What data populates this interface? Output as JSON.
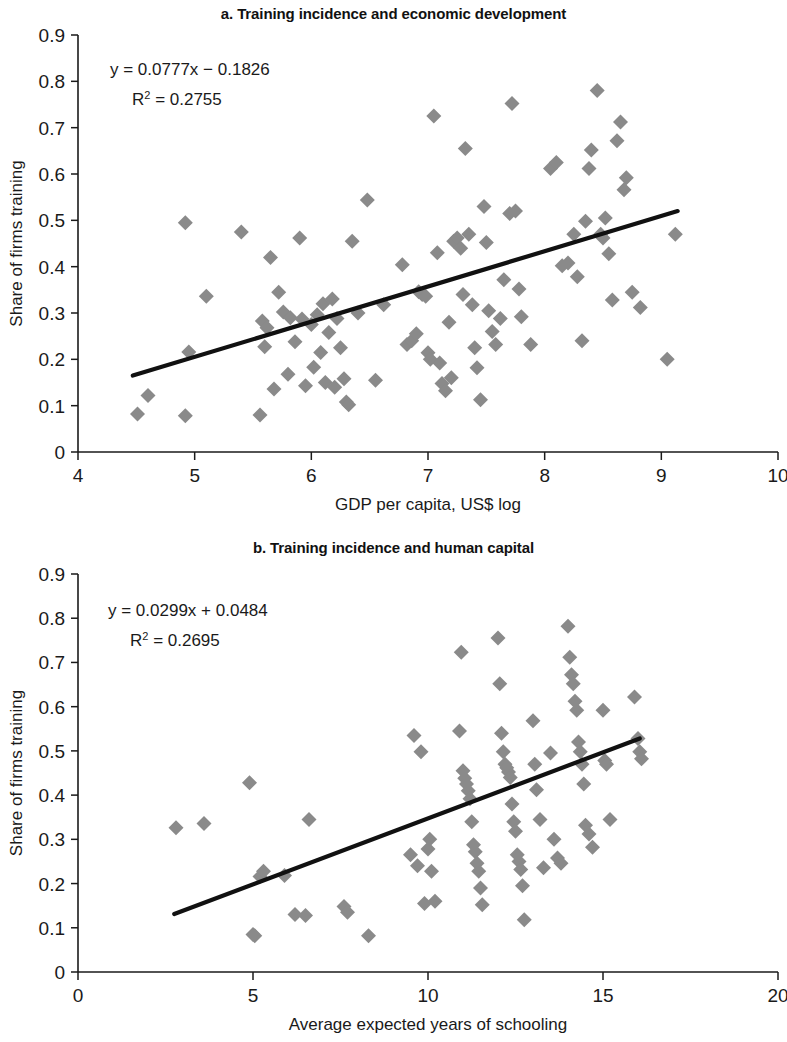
{
  "figure": {
    "background": "#ffffff",
    "marker_color": "#8a8a8a",
    "line_color": "#111111"
  },
  "chart_data": [
    {
      "type": "scatter",
      "panel": "a",
      "title": "a. Training incidence and economic development",
      "xlabel": "GDP per capita, US$ log",
      "ylabel": "Share of firms training",
      "xlim": [
        4,
        10
      ],
      "ylim": [
        0,
        0.9
      ],
      "xticks": [
        4,
        5,
        6,
        7,
        8,
        9,
        10
      ],
      "xtick_labels": [
        "4",
        "5",
        "6",
        "7",
        "8",
        "9",
        "10"
      ],
      "yticks": [
        0,
        0.1,
        0.2,
        0.3,
        0.4,
        0.5,
        0.6,
        0.7,
        0.8,
        0.9
      ],
      "ytick_labels": [
        "0",
        "0.1",
        "0.2",
        "0.3",
        "0.4",
        "0.5",
        "0.6",
        "0.7",
        "0.8",
        "0.9"
      ],
      "grid": false,
      "legend": "none",
      "annotations": {
        "equation": "y = 0.0777x − 0.1826",
        "r_squared_prefix": "R",
        "r_squared_sup": "2",
        "r_squared_value": " = 0.2755"
      },
      "trendline": {
        "slope": 0.0777,
        "intercept": -0.1826,
        "x_start": 4.47,
        "x_end": 9.14,
        "y_start": 0.165,
        "y_end": 0.52
      },
      "points": [
        [
          4.51,
          0.082
        ],
        [
          4.6,
          0.122
        ],
        [
          4.92,
          0.078
        ],
        [
          4.92,
          0.495
        ],
        [
          4.95,
          0.216
        ],
        [
          5.1,
          0.336
        ],
        [
          5.4,
          0.475
        ],
        [
          5.56,
          0.08
        ],
        [
          5.58,
          0.283
        ],
        [
          5.6,
          0.227
        ],
        [
          5.62,
          0.268
        ],
        [
          5.65,
          0.42
        ],
        [
          5.68,
          0.136
        ],
        [
          5.72,
          0.345
        ],
        [
          5.76,
          0.302
        ],
        [
          5.8,
          0.168
        ],
        [
          5.82,
          0.29
        ],
        [
          5.86,
          0.238
        ],
        [
          5.9,
          0.462
        ],
        [
          5.92,
          0.287
        ],
        [
          5.95,
          0.143
        ],
        [
          6.0,
          0.275
        ],
        [
          6.02,
          0.183
        ],
        [
          6.05,
          0.296
        ],
        [
          6.08,
          0.215
        ],
        [
          6.1,
          0.32
        ],
        [
          6.12,
          0.15
        ],
        [
          6.15,
          0.258
        ],
        [
          6.18,
          0.33
        ],
        [
          6.2,
          0.14
        ],
        [
          6.22,
          0.288
        ],
        [
          6.25,
          0.225
        ],
        [
          6.28,
          0.158
        ],
        [
          6.3,
          0.108
        ],
        [
          6.32,
          0.102
        ],
        [
          6.35,
          0.455
        ],
        [
          6.4,
          0.3
        ],
        [
          6.48,
          0.544
        ],
        [
          6.55,
          0.155
        ],
        [
          6.62,
          0.318
        ],
        [
          6.78,
          0.404
        ],
        [
          6.82,
          0.232
        ],
        [
          6.86,
          0.24
        ],
        [
          6.9,
          0.255
        ],
        [
          6.92,
          0.346
        ],
        [
          6.95,
          0.34
        ],
        [
          6.98,
          0.336
        ],
        [
          7.0,
          0.214
        ],
        [
          7.02,
          0.2
        ],
        [
          7.05,
          0.725
        ],
        [
          7.08,
          0.43
        ],
        [
          7.1,
          0.192
        ],
        [
          7.12,
          0.148
        ],
        [
          7.15,
          0.132
        ],
        [
          7.18,
          0.28
        ],
        [
          7.2,
          0.16
        ],
        [
          7.22,
          0.455
        ],
        [
          7.25,
          0.462
        ],
        [
          7.28,
          0.44
        ],
        [
          7.3,
          0.34
        ],
        [
          7.32,
          0.655
        ],
        [
          7.35,
          0.47
        ],
        [
          7.38,
          0.318
        ],
        [
          7.4,
          0.225
        ],
        [
          7.42,
          0.182
        ],
        [
          7.45,
          0.113
        ],
        [
          7.48,
          0.53
        ],
        [
          7.5,
          0.452
        ],
        [
          7.52,
          0.305
        ],
        [
          7.55,
          0.26
        ],
        [
          7.58,
          0.232
        ],
        [
          7.62,
          0.288
        ],
        [
          7.65,
          0.372
        ],
        [
          7.7,
          0.515
        ],
        [
          7.72,
          0.752
        ],
        [
          7.75,
          0.52
        ],
        [
          7.78,
          0.352
        ],
        [
          7.8,
          0.292
        ],
        [
          7.88,
          0.232
        ],
        [
          8.05,
          0.612
        ],
        [
          8.1,
          0.625
        ],
        [
          8.15,
          0.402
        ],
        [
          8.2,
          0.408
        ],
        [
          8.25,
          0.47
        ],
        [
          8.28,
          0.378
        ],
        [
          8.32,
          0.24
        ],
        [
          8.35,
          0.498
        ],
        [
          8.38,
          0.612
        ],
        [
          8.4,
          0.652
        ],
        [
          8.45,
          0.78
        ],
        [
          8.48,
          0.47
        ],
        [
          8.5,
          0.462
        ],
        [
          8.52,
          0.505
        ],
        [
          8.55,
          0.428
        ],
        [
          8.58,
          0.328
        ],
        [
          8.62,
          0.672
        ],
        [
          8.65,
          0.712
        ],
        [
          8.68,
          0.566
        ],
        [
          8.7,
          0.592
        ],
        [
          8.75,
          0.345
        ],
        [
          8.82,
          0.312
        ],
        [
          9.05,
          0.2
        ],
        [
          9.12,
          0.47
        ]
      ]
    },
    {
      "type": "scatter",
      "panel": "b",
      "title": "b. Training incidence and human capital",
      "xlabel": "Average expected years of schooling",
      "ylabel": "Share of firms training",
      "xlim": [
        0,
        20
      ],
      "ylim": [
        0,
        0.9
      ],
      "xticks": [
        0,
        5,
        10,
        15,
        20
      ],
      "xtick_labels": [
        "0",
        "5",
        "10",
        "15",
        "20"
      ],
      "yticks": [
        0,
        0.1,
        0.2,
        0.3,
        0.4,
        0.5,
        0.6,
        0.7,
        0.8,
        0.9
      ],
      "ytick_labels": [
        "0",
        "0.1",
        "0.2",
        "0.3",
        "0.4",
        "0.5",
        "0.6",
        "0.7",
        "0.8",
        "0.9"
      ],
      "grid": false,
      "legend": "none",
      "annotations": {
        "equation": "y = 0.0299x + 0.0484",
        "r_squared_prefix": "R",
        "r_squared_sup": "2",
        "r_squared_value": " = 0.2695"
      },
      "trendline": {
        "slope": 0.0299,
        "intercept": 0.0484,
        "x_start": 2.75,
        "x_end": 16.05,
        "y_start": 0.131,
        "y_end": 0.528
      },
      "points": [
        [
          2.8,
          0.326
        ],
        [
          3.6,
          0.336
        ],
        [
          4.9,
          0.428
        ],
        [
          5.0,
          0.085
        ],
        [
          5.05,
          0.082
        ],
        [
          5.2,
          0.216
        ],
        [
          5.3,
          0.228
        ],
        [
          5.9,
          0.218
        ],
        [
          6.2,
          0.13
        ],
        [
          6.5,
          0.128
        ],
        [
          6.6,
          0.345
        ],
        [
          7.6,
          0.148
        ],
        [
          7.7,
          0.135
        ],
        [
          8.3,
          0.082
        ],
        [
          9.5,
          0.265
        ],
        [
          9.6,
          0.535
        ],
        [
          9.7,
          0.24
        ],
        [
          9.8,
          0.498
        ],
        [
          9.9,
          0.155
        ],
        [
          10.0,
          0.278
        ],
        [
          10.05,
          0.3
        ],
        [
          10.1,
          0.228
        ],
        [
          10.2,
          0.16
        ],
        [
          10.9,
          0.545
        ],
        [
          10.95,
          0.723
        ],
        [
          11.0,
          0.455
        ],
        [
          11.05,
          0.438
        ],
        [
          11.1,
          0.425
        ],
        [
          11.15,
          0.41
        ],
        [
          11.2,
          0.392
        ],
        [
          11.25,
          0.34
        ],
        [
          11.3,
          0.288
        ],
        [
          11.35,
          0.272
        ],
        [
          11.4,
          0.246
        ],
        [
          11.45,
          0.228
        ],
        [
          11.5,
          0.19
        ],
        [
          11.55,
          0.152
        ],
        [
          12.0,
          0.755
        ],
        [
          12.05,
          0.652
        ],
        [
          12.1,
          0.54
        ],
        [
          12.15,
          0.498
        ],
        [
          12.2,
          0.47
        ],
        [
          12.25,
          0.462
        ],
        [
          12.3,
          0.452
        ],
        [
          12.35,
          0.44
        ],
        [
          12.4,
          0.38
        ],
        [
          12.45,
          0.34
        ],
        [
          12.5,
          0.318
        ],
        [
          12.55,
          0.265
        ],
        [
          12.6,
          0.25
        ],
        [
          12.65,
          0.232
        ],
        [
          12.7,
          0.195
        ],
        [
          12.75,
          0.118
        ],
        [
          13.0,
          0.568
        ],
        [
          13.05,
          0.47
        ],
        [
          13.1,
          0.412
        ],
        [
          13.2,
          0.345
        ],
        [
          13.3,
          0.236
        ],
        [
          13.5,
          0.495
        ],
        [
          13.6,
          0.3
        ],
        [
          13.7,
          0.258
        ],
        [
          13.8,
          0.246
        ],
        [
          14.0,
          0.782
        ],
        [
          14.05,
          0.712
        ],
        [
          14.1,
          0.672
        ],
        [
          14.15,
          0.652
        ],
        [
          14.2,
          0.612
        ],
        [
          14.25,
          0.592
        ],
        [
          14.3,
          0.52
        ],
        [
          14.35,
          0.498
        ],
        [
          14.4,
          0.47
        ],
        [
          14.45,
          0.425
        ],
        [
          14.5,
          0.332
        ],
        [
          14.6,
          0.312
        ],
        [
          14.7,
          0.282
        ],
        [
          15.0,
          0.592
        ],
        [
          15.05,
          0.478
        ],
        [
          15.1,
          0.47
        ],
        [
          15.2,
          0.345
        ],
        [
          15.9,
          0.622
        ],
        [
          16.0,
          0.528
        ],
        [
          16.05,
          0.498
        ],
        [
          16.1,
          0.482
        ]
      ]
    }
  ]
}
